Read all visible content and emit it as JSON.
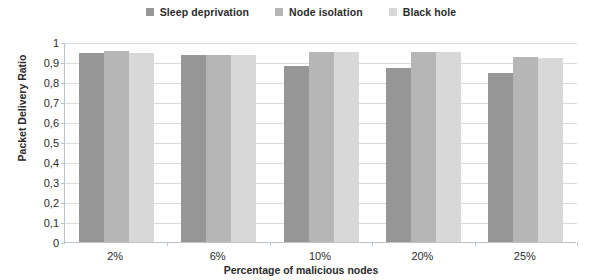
{
  "chart_data": {
    "type": "bar",
    "title": "",
    "xlabel": "Percentage of malicious nodes",
    "ylabel": "Packet Delivery Ratio",
    "categories": [
      "2%",
      "6%",
      "10%",
      "20%",
      "25%"
    ],
    "ylim": [
      0,
      1
    ],
    "ytick_labels": [
      "1",
      "0,9",
      "0,8",
      "0,7",
      "0,6",
      "0,5",
      "0,4",
      "0,3",
      "0,2",
      "0,1",
      "0"
    ],
    "ytick_values": [
      1,
      0.9,
      0.8,
      0.7,
      0.6,
      0.5,
      0.4,
      0.3,
      0.2,
      0.1,
      0
    ],
    "grid": true,
    "legend_position": "top-center",
    "series": [
      {
        "name": "Sleep deprivation",
        "color": "#969696",
        "values": [
          0.945,
          0.935,
          0.88,
          0.87,
          0.845
        ]
      },
      {
        "name": "Node isolation",
        "color": "#b6b6b6",
        "values": [
          0.955,
          0.935,
          0.95,
          0.95,
          0.925
        ]
      },
      {
        "name": "Black hole",
        "color": "#d8d8d8",
        "values": [
          0.945,
          0.935,
          0.95,
          0.95,
          0.92
        ]
      }
    ]
  },
  "axis_colors": {
    "gridline": "#d4dde3",
    "axis_line": "#b9c4cc",
    "text": "#2b2b2b"
  }
}
